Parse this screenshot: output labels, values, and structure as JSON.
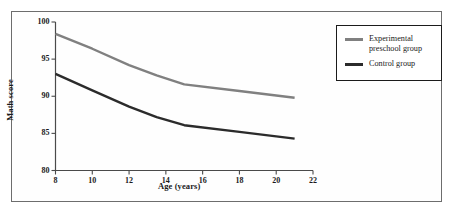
{
  "figure": {
    "background_color": "#ffffff",
    "border_color": "#6d6d6d"
  },
  "chart_data": {
    "type": "line",
    "title": "",
    "subtitle": "",
    "xlabel": "Age (years)",
    "ylabel": "Math score",
    "xlim": [
      8,
      22
    ],
    "ylim": [
      80,
      100
    ],
    "xticks": [
      8,
      10,
      12,
      14,
      16,
      18,
      20,
      22
    ],
    "xtick_labels": [
      "8",
      "10",
      "12",
      "14",
      "16",
      "18",
      "20",
      "22"
    ],
    "yticks": [
      80,
      85,
      90,
      95,
      100
    ],
    "ytick_labels": [
      "80",
      "85",
      "90",
      "95",
      "100"
    ],
    "grid": false,
    "legend_position": "upper right outside",
    "series": [
      {
        "name": "Experimental preschool group",
        "legend_label": "Experimental\npreschool group",
        "color": "#808080",
        "linewidth": 2.4,
        "x": [
          8,
          10,
          12,
          13.5,
          15,
          18,
          21
        ],
        "values": [
          98.4,
          96.4,
          94.2,
          92.8,
          91.6,
          90.7,
          89.8
        ]
      },
      {
        "name": "Control group",
        "legend_label": "Control group",
        "color": "#2b2b2b",
        "linewidth": 2.4,
        "x": [
          8,
          10,
          12,
          13.5,
          15,
          18,
          21
        ],
        "values": [
          93.0,
          90.8,
          88.6,
          87.2,
          86.1,
          85.2,
          84.3
        ]
      }
    ]
  },
  "legend": {
    "entries": [
      {
        "label": "Experimental\npreschool group",
        "color": "#808080"
      },
      {
        "label": "Control group",
        "color": "#2b2b2b"
      }
    ]
  }
}
